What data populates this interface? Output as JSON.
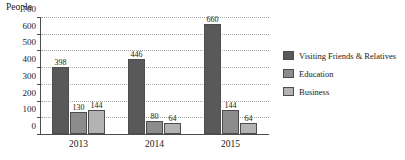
{
  "chart_data": {
    "type": "bar",
    "title": "",
    "ylabel": "People",
    "xlabel": "",
    "categories": [
      "2013",
      "2014",
      "2015"
    ],
    "series": [
      {
        "name": "Visiting Friends & Relatives",
        "color": "#595959",
        "values": [
          398,
          446,
          660
        ],
        "labels": [
          "398",
          "446",
          "660"
        ]
      },
      {
        "name": "Education",
        "color": "#8c8c8c",
        "values": [
          130,
          80,
          144
        ],
        "labels": [
          "130",
          "80",
          "144"
        ]
      },
      {
        "name": "Business",
        "color": "#b3b3b3",
        "values": [
          144,
          64,
          64
        ],
        "labels": [
          "144",
          "64",
          "64"
        ]
      }
    ],
    "ylim": [
      0,
      700
    ],
    "yticks": [
      "0",
      "100",
      "200",
      "300",
      "400",
      "500",
      "600",
      "700"
    ],
    "grid": true,
    "legend_position": "right"
  },
  "legend": {
    "items": [
      {
        "label": "Visiting Friends & Relatives",
        "color": "#595959"
      },
      {
        "label": "Education",
        "color": "#8c8c8c"
      },
      {
        "label": "Business",
        "color": "#b3b3b3"
      }
    ]
  },
  "axis": {
    "y_title": "People"
  }
}
